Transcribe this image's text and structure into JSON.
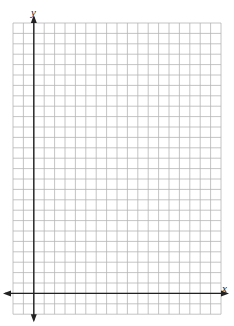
{
  "graph": {
    "x_label": "x",
    "y_label": "y",
    "grid": {
      "left": 13,
      "top": 23,
      "cols": 20,
      "rows": 28,
      "cell": 10.4,
      "color": "#b5b5b5"
    },
    "axes": {
      "x_axis_row_from_bottom": 2,
      "y_axis_col_from_left": 2,
      "color": "#222222"
    }
  }
}
